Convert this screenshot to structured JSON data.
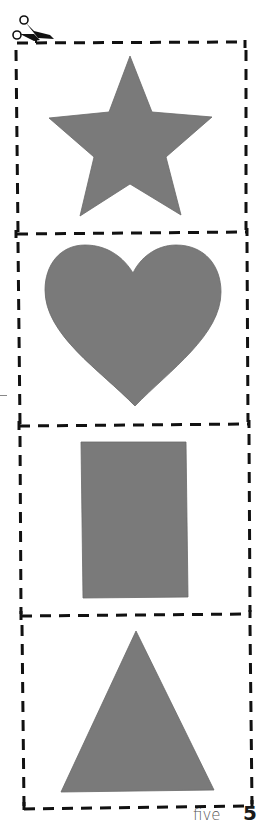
{
  "worksheet": {
    "type": "cut-out shapes",
    "cut_line_style": "dashed",
    "cut_line_color": "#111111",
    "shape_fill_color": "#7a7a7a",
    "background_color": "#ffffff",
    "panels": [
      {
        "shape": "star"
      },
      {
        "shape": "heart"
      },
      {
        "shape": "rectangle"
      },
      {
        "shape": "triangle"
      }
    ],
    "icons": {
      "cut_marker": "scissors-icon"
    }
  },
  "footer": {
    "page_word": "five",
    "page_number": "5"
  }
}
